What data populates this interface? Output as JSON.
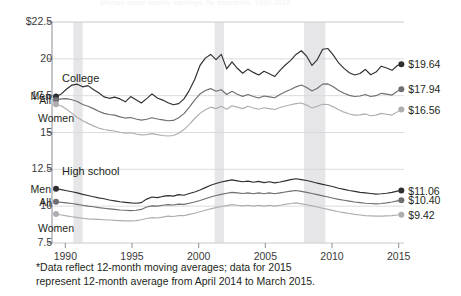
{
  "figure": {
    "faint_top_title": "Median usual weekly earnings, by education, 1990-2015",
    "footnote_line1": "*Data reflect 12-month moving averages; data for 2015",
    "footnote_line2": "represent 12-month average from April 2014 to  March 2015.",
    "colors": {
      "men": "#2f2f33",
      "all": "#6e6e73",
      "women": "#aeaeb2",
      "grid": "#d8d8dc",
      "axis": "#8e8e93",
      "recession_band": "#e6e6e8",
      "text": "#231f20"
    }
  },
  "chart_data": {
    "type": "line",
    "title": "",
    "xlabel": "",
    "ylabel": "",
    "grid": true,
    "legend_position": "inline-labels",
    "xlim": [
      1989.0,
      2015.4
    ],
    "ylim": [
      7.5,
      22.5
    ],
    "yticks": [
      "$22.5",
      "20",
      "17.5",
      "15",
      "12.5",
      "10",
      "7.5"
    ],
    "ytick_values": [
      22.5,
      20,
      17.5,
      15,
      12.5,
      10,
      7.5
    ],
    "xticks": [
      "1990",
      "1995",
      "2000",
      "2005",
      "2010",
      "2015"
    ],
    "xtick_values": [
      1990,
      1995,
      2000,
      2005,
      2010,
      2015
    ],
    "recession_bands": [
      [
        1990.6,
        1991.3
      ],
      [
        2001.2,
        2001.9
      ],
      [
        2007.9,
        2009.5
      ]
    ],
    "panels": [
      {
        "name": "college",
        "label": "College",
        "series": [
          {
            "name": "Men",
            "label": "Men",
            "end_label": "$19.64",
            "end_value": 19.64,
            "color": "#2f2f33",
            "x": [
              1989.3,
              1989.7,
              1990.1,
              1990.5,
              1990.9,
              1991.3,
              1991.7,
              1992.1,
              1992.5,
              1992.9,
              1993.3,
              1993.7,
              1994.1,
              1994.5,
              1994.9,
              1995.3,
              1995.7,
              1996.1,
              1996.5,
              1996.9,
              1997.3,
              1997.7,
              1998.1,
              1998.5,
              1998.9,
              1999.3,
              1999.7,
              2000.1,
              2000.5,
              2000.9,
              2001.3,
              2001.7,
              2002.1,
              2002.5,
              2002.9,
              2003.3,
              2003.7,
              2004.1,
              2004.5,
              2004.9,
              2005.3,
              2005.7,
              2006.1,
              2006.5,
              2006.9,
              2007.3,
              2007.7,
              2008.1,
              2008.5,
              2008.9,
              2009.3,
              2009.7,
              2010.1,
              2010.5,
              2010.9,
              2011.3,
              2011.7,
              2012.1,
              2012.5,
              2012.9,
              2013.3,
              2013.7,
              2014.1,
              2014.5,
              2014.9,
              2015.2
            ],
            "y": [
              17.45,
              17.62,
              17.95,
              18.22,
              18.28,
              18.1,
              18.18,
              17.92,
              17.7,
              17.42,
              17.32,
              17.4,
              17.28,
              17.08,
              17.44,
              17.22,
              17.0,
              17.3,
              17.62,
              17.34,
              17.2,
              17.02,
              16.88,
              16.96,
              17.28,
              17.86,
              18.6,
              19.55,
              20.05,
              20.3,
              19.95,
              20.3,
              19.32,
              19.8,
              19.36,
              19.02,
              19.3,
              19.08,
              18.9,
              19.16,
              18.98,
              18.8,
              19.22,
              19.58,
              19.9,
              20.3,
              20.55,
              20.18,
              19.55,
              19.95,
              20.65,
              20.7,
              20.25,
              19.72,
              19.35,
              19.06,
              18.9,
              19.0,
              19.28,
              18.92,
              19.1,
              19.5,
              19.38,
              19.22,
              19.55,
              19.64
            ]
          },
          {
            "name": "All",
            "label": "All",
            "end_label": "$17.94",
            "end_value": 17.94,
            "color": "#6e6e73",
            "x": [
              1989.3,
              1989.7,
              1990.1,
              1990.5,
              1990.9,
              1991.3,
              1991.7,
              1992.1,
              1992.5,
              1992.9,
              1993.3,
              1993.7,
              1994.1,
              1994.5,
              1994.9,
              1995.3,
              1995.7,
              1996.1,
              1996.5,
              1996.9,
              1997.3,
              1997.7,
              1998.1,
              1998.5,
              1998.9,
              1999.3,
              1999.7,
              2000.1,
              2000.5,
              2000.9,
              2001.3,
              2001.7,
              2002.1,
              2002.5,
              2002.9,
              2003.3,
              2003.7,
              2004.1,
              2004.5,
              2004.9,
              2005.3,
              2005.7,
              2006.1,
              2006.5,
              2006.9,
              2007.3,
              2007.7,
              2008.1,
              2008.5,
              2008.9,
              2009.3,
              2009.7,
              2010.1,
              2010.5,
              2010.9,
              2011.3,
              2011.7,
              2012.1,
              2012.5,
              2012.9,
              2013.3,
              2013.7,
              2014.1,
              2014.5,
              2014.9,
              2015.2
            ],
            "y": [
              17.2,
              17.28,
              17.3,
              17.22,
              17.1,
              16.9,
              16.78,
              16.62,
              16.44,
              16.3,
              16.22,
              16.18,
              16.06,
              15.98,
              16.02,
              15.92,
              15.84,
              15.9,
              16.0,
              15.92,
              15.86,
              15.8,
              15.82,
              16.0,
              16.28,
              16.72,
              17.2,
              17.62,
              17.85,
              17.98,
              17.8,
              17.9,
              17.58,
              17.8,
              17.6,
              17.45,
              17.58,
              17.44,
              17.34,
              17.48,
              17.42,
              17.36,
              17.58,
              17.76,
              17.92,
              18.1,
              18.22,
              18.06,
              17.82,
              18.0,
              18.28,
              18.3,
              18.1,
              17.85,
              17.66,
              17.52,
              17.44,
              17.48,
              17.58,
              17.44,
              17.5,
              17.66,
              17.6,
              17.54,
              17.8,
              17.94
            ]
          },
          {
            "name": "Women",
            "label": "Women",
            "end_label": "$16.56",
            "end_value": 16.56,
            "color": "#aeaeb2",
            "x": [
              1989.3,
              1989.7,
              1990.1,
              1990.5,
              1990.9,
              1991.3,
              1991.7,
              1992.1,
              1992.5,
              1992.9,
              1993.3,
              1993.7,
              1994.1,
              1994.5,
              1994.9,
              1995.3,
              1995.7,
              1996.1,
              1996.5,
              1996.9,
              1997.3,
              1997.7,
              1998.1,
              1998.5,
              1998.9,
              1999.3,
              1999.7,
              2000.1,
              2000.5,
              2000.9,
              2001.3,
              2001.7,
              2002.1,
              2002.5,
              2002.9,
              2003.3,
              2003.7,
              2004.1,
              2004.5,
              2004.9,
              2005.3,
              2005.7,
              2006.1,
              2006.5,
              2006.9,
              2007.3,
              2007.7,
              2008.1,
              2008.5,
              2008.9,
              2009.3,
              2009.7,
              2010.1,
              2010.5,
              2010.9,
              2011.3,
              2011.7,
              2012.1,
              2012.5,
              2012.9,
              2013.3,
              2013.7,
              2014.1,
              2014.5,
              2014.9,
              2015.2
            ],
            "y": [
              16.92,
              16.8,
              16.58,
              16.3,
              16.02,
              15.8,
              15.62,
              15.45,
              15.3,
              15.2,
              15.14,
              15.1,
              15.02,
              14.96,
              14.98,
              14.9,
              14.84,
              14.86,
              14.92,
              14.86,
              14.8,
              14.76,
              14.8,
              14.95,
              15.2,
              15.55,
              15.95,
              16.3,
              16.55,
              16.72,
              16.62,
              16.78,
              16.58,
              16.82,
              16.72,
              16.62,
              16.78,
              16.66,
              16.58,
              16.68,
              16.62,
              16.56,
              16.7,
              16.8,
              16.88,
              16.96,
              17.0,
              16.86,
              16.66,
              16.78,
              16.92,
              16.9,
              16.74,
              16.54,
              16.38,
              16.26,
              16.18,
              16.2,
              16.26,
              16.14,
              16.18,
              16.3,
              16.24,
              16.18,
              16.4,
              16.56
            ]
          }
        ]
      },
      {
        "name": "high-school",
        "label": "High school",
        "series": [
          {
            "name": "Men",
            "label": "Men",
            "end_label": "$11.06",
            "end_value": 11.06,
            "color": "#2f2f33",
            "x": [
              1989.3,
              1989.7,
              1990.1,
              1990.5,
              1990.9,
              1991.3,
              1991.7,
              1992.1,
              1992.5,
              1992.9,
              1993.3,
              1993.7,
              1994.1,
              1994.5,
              1994.9,
              1995.3,
              1995.7,
              1996.1,
              1996.5,
              1996.9,
              1997.3,
              1997.7,
              1998.1,
              1998.5,
              1998.9,
              1999.3,
              1999.7,
              2000.1,
              2000.5,
              2000.9,
              2001.3,
              2001.7,
              2002.1,
              2002.5,
              2002.9,
              2003.3,
              2003.7,
              2004.1,
              2004.5,
              2004.9,
              2005.3,
              2005.7,
              2006.1,
              2006.5,
              2006.9,
              2007.3,
              2007.7,
              2008.1,
              2008.5,
              2008.9,
              2009.3,
              2009.7,
              2010.1,
              2010.5,
              2010.9,
              2011.3,
              2011.7,
              2012.1,
              2012.5,
              2012.9,
              2013.3,
              2013.7,
              2014.1,
              2014.5,
              2014.9,
              2015.2
            ],
            "y": [
              11.18,
              11.12,
              11.05,
              10.98,
              10.9,
              10.8,
              10.72,
              10.64,
              10.56,
              10.5,
              10.42,
              10.36,
              10.3,
              10.26,
              10.22,
              10.2,
              10.24,
              10.48,
              10.62,
              10.58,
              10.66,
              10.72,
              10.68,
              10.78,
              10.74,
              10.86,
              10.96,
              11.1,
              11.26,
              11.42,
              11.54,
              11.64,
              11.72,
              11.78,
              11.72,
              11.66,
              11.7,
              11.62,
              11.68,
              11.6,
              11.66,
              11.58,
              11.64,
              11.72,
              11.8,
              11.86,
              11.8,
              11.74,
              11.66,
              11.56,
              11.48,
              11.4,
              11.32,
              11.22,
              11.14,
              11.06,
              11.0,
              10.94,
              10.9,
              10.86,
              10.82,
              10.84,
              10.88,
              10.94,
              11.02,
              11.06
            ]
          },
          {
            "name": "All",
            "label": "All",
            "end_label": "$10.40",
            "end_value": 10.4,
            "color": "#6e6e73",
            "x": [
              1989.3,
              1989.7,
              1990.1,
              1990.5,
              1990.9,
              1991.3,
              1991.7,
              1992.1,
              1992.5,
              1992.9,
              1993.3,
              1993.7,
              1994.1,
              1994.5,
              1994.9,
              1995.3,
              1995.7,
              1996.1,
              1996.5,
              1996.9,
              1997.3,
              1997.7,
              1998.1,
              1998.5,
              1998.9,
              1999.3,
              1999.7,
              2000.1,
              2000.5,
              2000.9,
              2001.3,
              2001.7,
              2002.1,
              2002.5,
              2002.9,
              2003.3,
              2003.7,
              2004.1,
              2004.5,
              2004.9,
              2005.3,
              2005.7,
              2006.1,
              2006.5,
              2006.9,
              2007.3,
              2007.7,
              2008.1,
              2008.5,
              2008.9,
              2009.3,
              2009.7,
              2010.1,
              2010.5,
              2010.9,
              2011.3,
              2011.7,
              2012.1,
              2012.5,
              2012.9,
              2013.3,
              2013.7,
              2014.1,
              2014.5,
              2014.9,
              2015.2
            ],
            "y": [
              10.3,
              10.26,
              10.22,
              10.18,
              10.12,
              10.06,
              10.0,
              9.96,
              9.9,
              9.86,
              9.82,
              9.78,
              9.74,
              9.72,
              9.7,
              9.72,
              9.78,
              9.94,
              10.02,
              10.0,
              10.06,
              10.1,
              10.08,
              10.14,
              10.12,
              10.2,
              10.28,
              10.38,
              10.5,
              10.62,
              10.72,
              10.8,
              10.88,
              10.94,
              10.9,
              10.86,
              10.9,
              10.84,
              10.9,
              10.84,
              10.9,
              10.84,
              10.9,
              10.96,
              11.02,
              11.06,
              11.0,
              10.94,
              10.86,
              10.78,
              10.7,
              10.62,
              10.54,
              10.46,
              10.4,
              10.34,
              10.28,
              10.24,
              10.2,
              10.18,
              10.16,
              10.18,
              10.22,
              10.28,
              10.36,
              10.4
            ]
          },
          {
            "name": "Women",
            "label": "Women",
            "end_label": "$9.42",
            "end_value": 9.42,
            "color": "#aeaeb2",
            "x": [
              1989.3,
              1989.7,
              1990.1,
              1990.5,
              1990.9,
              1991.3,
              1991.7,
              1992.1,
              1992.5,
              1992.9,
              1993.3,
              1993.7,
              1994.1,
              1994.5,
              1994.9,
              1995.3,
              1995.7,
              1996.1,
              1996.5,
              1996.9,
              1997.3,
              1997.7,
              1998.1,
              1998.5,
              1998.9,
              1999.3,
              1999.7,
              2000.1,
              2000.5,
              2000.9,
              2001.3,
              2001.7,
              2002.1,
              2002.5,
              2002.9,
              2003.3,
              2003.7,
              2004.1,
              2004.5,
              2004.9,
              2005.3,
              2005.7,
              2006.1,
              2006.5,
              2006.9,
              2007.3,
              2007.7,
              2008.1,
              2008.5,
              2008.9,
              2009.3,
              2009.7,
              2010.1,
              2010.5,
              2010.9,
              2011.3,
              2011.7,
              2012.1,
              2012.5,
              2012.9,
              2013.3,
              2013.7,
              2014.1,
              2014.5,
              2014.9,
              2015.2
            ],
            "y": [
              9.46,
              9.4,
              9.34,
              9.28,
              9.22,
              9.18,
              9.14,
              9.12,
              9.1,
              9.08,
              9.06,
              9.04,
              9.02,
              9.0,
              9.0,
              9.02,
              9.08,
              9.16,
              9.22,
              9.2,
              9.26,
              9.32,
              9.3,
              9.36,
              9.36,
              9.44,
              9.52,
              9.62,
              9.72,
              9.82,
              9.9,
              9.98,
              10.04,
              10.1,
              10.06,
              10.02,
              10.06,
              10.0,
              10.06,
              10.0,
              10.06,
              10.0,
              10.06,
              10.12,
              10.18,
              10.22,
              10.16,
              10.1,
              10.02,
              9.94,
              9.86,
              9.78,
              9.7,
              9.62,
              9.56,
              9.5,
              9.44,
              9.4,
              9.36,
              9.34,
              9.32,
              9.32,
              9.34,
              9.36,
              9.4,
              9.42
            ]
          }
        ]
      }
    ]
  }
}
